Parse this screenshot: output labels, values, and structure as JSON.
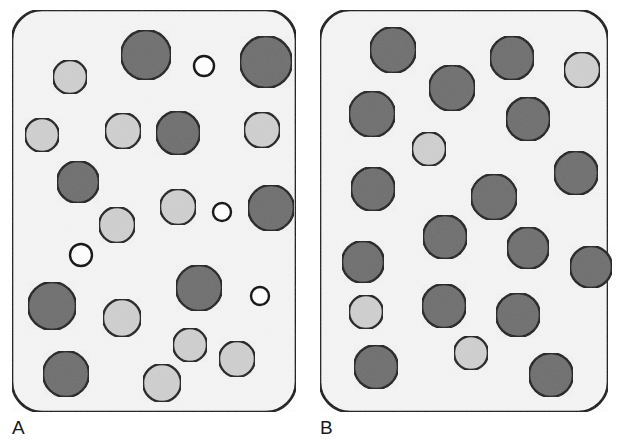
{
  "figure": {
    "type": "schematic-diagram",
    "title": "",
    "background_color": "#ffffff"
  },
  "style": {
    "panel_fill": "#f4f4f4",
    "panel_stroke": "#111111",
    "panel_stroke_width": 2.6,
    "panel_corner_radius": 30,
    "circle_stroke": "#1a1a1a",
    "circle_stroke_width": 2.4,
    "color_dark": "#6f6f6f",
    "color_light": "#cfcfcf",
    "color_white": "#fdfdfd",
    "label_color": "#1a1a1a"
  },
  "panels": [
    {
      "id": "panel-a",
      "label": "A",
      "label_x": 12,
      "label_y": 418,
      "box": {
        "x": 12,
        "y": 10,
        "width": 284,
        "height": 402
      },
      "description": "polydisperse mixture of large, medium and small particles",
      "circles": [
        {
          "cx": 146,
          "cy": 55,
          "r": 25,
          "shade": "dark"
        },
        {
          "cx": 70,
          "cy": 77,
          "r": 17,
          "shade": "light"
        },
        {
          "cx": 204,
          "cy": 66,
          "r": 10,
          "shade": "white"
        },
        {
          "cx": 266,
          "cy": 62,
          "r": 26,
          "shade": "dark"
        },
        {
          "cx": 42,
          "cy": 135,
          "r": 17,
          "shade": "light"
        },
        {
          "cx": 123,
          "cy": 131,
          "r": 18,
          "shade": "light"
        },
        {
          "cx": 178,
          "cy": 133,
          "r": 22,
          "shade": "dark"
        },
        {
          "cx": 262,
          "cy": 130,
          "r": 18,
          "shade": "light"
        },
        {
          "cx": 78,
          "cy": 182,
          "r": 21,
          "shade": "dark"
        },
        {
          "cx": 178,
          "cy": 207,
          "r": 18,
          "shade": "light"
        },
        {
          "cx": 222,
          "cy": 212,
          "r": 9,
          "shade": "white"
        },
        {
          "cx": 271,
          "cy": 208,
          "r": 23,
          "shade": "dark"
        },
        {
          "cx": 117,
          "cy": 225,
          "r": 18,
          "shade": "light"
        },
        {
          "cx": 81,
          "cy": 255,
          "r": 11,
          "shade": "white"
        },
        {
          "cx": 199,
          "cy": 288,
          "r": 23,
          "shade": "dark"
        },
        {
          "cx": 260,
          "cy": 296,
          "r": 9,
          "shade": "white"
        },
        {
          "cx": 52,
          "cy": 306,
          "r": 24,
          "shade": "dark"
        },
        {
          "cx": 122,
          "cy": 318,
          "r": 19,
          "shade": "light"
        },
        {
          "cx": 190,
          "cy": 345,
          "r": 17,
          "shade": "light"
        },
        {
          "cx": 237,
          "cy": 359,
          "r": 18,
          "shade": "light"
        },
        {
          "cx": 66,
          "cy": 374,
          "r": 23,
          "shade": "dark"
        },
        {
          "cx": 162,
          "cy": 383,
          "r": 19,
          "shade": "light"
        }
      ]
    },
    {
      "id": "panel-b",
      "label": "B",
      "label_x": 320,
      "label_y": 418,
      "box": {
        "x": 320,
        "y": 10,
        "width": 288,
        "height": 402
      },
      "description": "near-monodisperse particles of similar size",
      "circles": [
        {
          "cx": 393,
          "cy": 50,
          "r": 23,
          "shade": "dark"
        },
        {
          "cx": 452,
          "cy": 88,
          "r": 23,
          "shade": "dark"
        },
        {
          "cx": 512,
          "cy": 58,
          "r": 22,
          "shade": "dark"
        },
        {
          "cx": 582,
          "cy": 70,
          "r": 18,
          "shade": "light"
        },
        {
          "cx": 372,
          "cy": 114,
          "r": 23,
          "shade": "dark"
        },
        {
          "cx": 528,
          "cy": 119,
          "r": 22,
          "shade": "dark"
        },
        {
          "cx": 429,
          "cy": 149,
          "r": 17,
          "shade": "light"
        },
        {
          "cx": 576,
          "cy": 173,
          "r": 22,
          "shade": "dark"
        },
        {
          "cx": 373,
          "cy": 189,
          "r": 22,
          "shade": "dark"
        },
        {
          "cx": 494,
          "cy": 197,
          "r": 23,
          "shade": "dark"
        },
        {
          "cx": 445,
          "cy": 237,
          "r": 22,
          "shade": "dark"
        },
        {
          "cx": 528,
          "cy": 248,
          "r": 21,
          "shade": "dark"
        },
        {
          "cx": 363,
          "cy": 262,
          "r": 21,
          "shade": "dark"
        },
        {
          "cx": 591,
          "cy": 267,
          "r": 21,
          "shade": "dark"
        },
        {
          "cx": 444,
          "cy": 306,
          "r": 22,
          "shade": "dark"
        },
        {
          "cx": 518,
          "cy": 315,
          "r": 22,
          "shade": "dark"
        },
        {
          "cx": 366,
          "cy": 312,
          "r": 17,
          "shade": "light"
        },
        {
          "cx": 471,
          "cy": 353,
          "r": 17,
          "shade": "light"
        },
        {
          "cx": 376,
          "cy": 367,
          "r": 22,
          "shade": "dark"
        },
        {
          "cx": 551,
          "cy": 375,
          "r": 22,
          "shade": "dark"
        }
      ]
    }
  ],
  "legend_counts": {
    "panel_a_total": 22,
    "panel_a_dark": 8,
    "panel_a_light": 10,
    "panel_a_white": 4,
    "panel_b_total": 20,
    "panel_b_dark": 17,
    "panel_b_light": 3
  }
}
